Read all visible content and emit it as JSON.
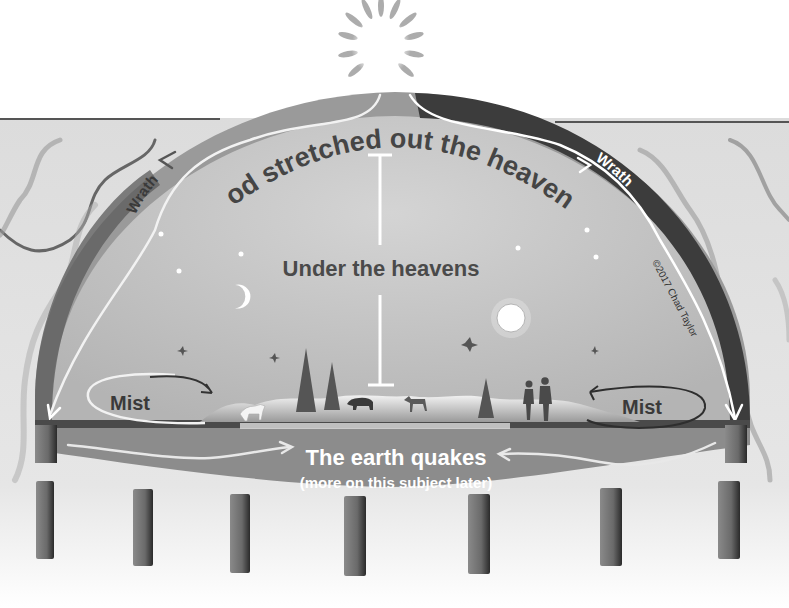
{
  "title": "God stretched out the heavens",
  "labels": {
    "dome_title": "God stretched out the heavens",
    "under": "Under the heavens",
    "wrath_left": "Wrath",
    "wrath_right": "Wrath",
    "mist_left": "Mist",
    "mist_right": "Mist",
    "earth_quakes": "The earth quakes",
    "earth_note": "(more on this subject later)",
    "copyright": "©2017 Chad Taylor"
  },
  "icons": [
    "sun-icon",
    "moon-icon",
    "full-moon-icon",
    "star-icon",
    "bird-icon",
    "tree-icon",
    "wolf-icon",
    "bear-icon",
    "deer-icon",
    "couple-icon",
    "pillar-icon",
    "arrow-icon"
  ],
  "colors": {
    "background": "#ffffff",
    "panel": "#e4e4e4",
    "dome_inner": "#c9c9c9",
    "dome_band": "#8a8a8a",
    "wrath_band_right": "#3a3a3a",
    "earth_band": "#8f8f8f",
    "text_dark": "#404040",
    "text_light": "#ffffff"
  },
  "pillar_count": 7
}
